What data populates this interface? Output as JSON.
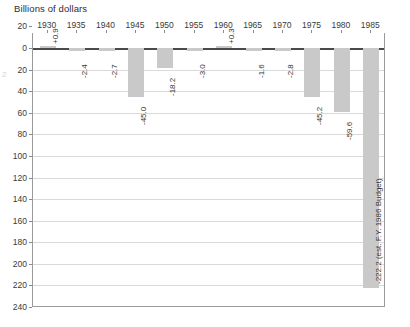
{
  "chart_data": {
    "type": "bar",
    "title": "Billions of dollars",
    "xlabel": "",
    "ylabel": "",
    "grid": true,
    "legend": "none",
    "orientation": "vertical",
    "axis_note": "Y axis values shown as positive magnitudes increasing downward; bars are federal surplus/deficit.",
    "ylim": [
      20,
      -240
    ],
    "yticks": [
      20,
      0,
      20,
      40,
      60,
      80,
      100,
      120,
      140,
      160,
      180,
      200,
      220,
      240
    ],
    "ytick_labels": [
      "20",
      "0",
      "20",
      "40",
      "60",
      "80",
      "100",
      "120",
      "140",
      "160",
      "180",
      "200",
      "220",
      "240"
    ],
    "categories": [
      "1930",
      "1935",
      "1940",
      "1945",
      "1950",
      "1955",
      "1960",
      "1965",
      "1970",
      "1975",
      "1980",
      "1985"
    ],
    "values": [
      0.9,
      -2.4,
      -2.7,
      -45.0,
      -18.2,
      -3.0,
      0.3,
      -1.6,
      -2.8,
      -45.2,
      -59.6,
      -222.2
    ],
    "data_labels": [
      "+0.9",
      "-2.4",
      "-2.7",
      "-45.0",
      "-18.2",
      "-3.0",
      "+0.3",
      "-1.6",
      "-2.8",
      "-45.2",
      "-59.6",
      "-222.2 (est. F.Y. 1986 Budget)"
    ],
    "bar_color": "#c9c9c9",
    "gridline_color": "#d9d9d9",
    "axis_color": "#4a4a4a",
    "annotations": [
      "-222.2 (est. F.Y. 1986 Budget)"
    ]
  },
  "scan": {
    "margin_artifact": "2"
  }
}
